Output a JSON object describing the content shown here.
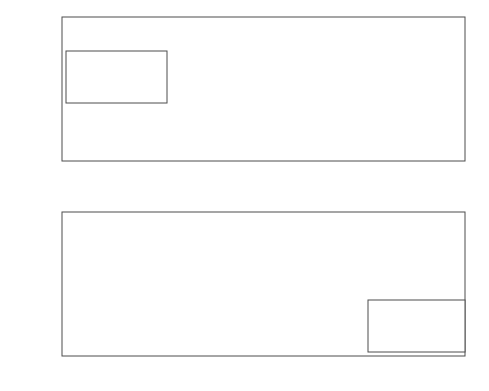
{
  "figure": {
    "title": "",
    "background": "#ffffff",
    "axis_color": "#4d4d4d",
    "grid_color": "#d0d0d0",
    "curve_color": "#3a3a3a",
    "solid_curve_color": "#8a8a8a"
  },
  "chart_data": [
    {
      "type": "line",
      "panel": "top",
      "title": "",
      "xlabel": "R",
      "ylabel": "|G_D|",
      "ylabel_display": "|G",
      "ylabel_sub": "D",
      "ylabel_tail": "|",
      "xlim": [
        0,
        1
      ],
      "ylim": [
        0,
        1.2
      ],
      "xticks": [
        0,
        0.2,
        0.4,
        0.6,
        0.8,
        1
      ],
      "xticklabels": [
        "0",
        "0.2",
        "0.4",
        "0.6",
        "0.8",
        "1"
      ],
      "yticks": [
        0,
        0.2,
        0.4,
        0.6,
        0.8,
        1,
        1.2
      ],
      "yticklabels": [
        "0",
        "0.2",
        "0.4",
        "0.6",
        "0.8",
        "1",
        "1.2"
      ],
      "grid": true,
      "legend_position": "upper-left",
      "series": [
        {
          "name": "eta_m = 0",
          "style": "solid",
          "x": [
            0,
            0.1,
            0.2,
            0.3,
            0.4,
            0.5,
            0.6,
            0.7,
            0.8,
            0.9,
            1.0
          ],
          "values": [
            1.0,
            1.0,
            1.0,
            1.0,
            1.0,
            1.0,
            1.0,
            1.0,
            1.0,
            1.0,
            1.0
          ]
        },
        {
          "name": "eta_m = 5",
          "style": "dashed",
          "x": [
            0,
            0.05,
            0.1,
            0.15,
            0.2,
            0.25,
            0.3,
            0.35,
            0.4,
            0.45,
            0.5,
            0.55,
            0.6,
            0.65,
            0.7,
            0.75,
            0.8,
            0.85,
            0.9,
            0.95,
            1.0
          ],
          "values": [
            0.292,
            0.288,
            0.286,
            0.285,
            0.285,
            0.287,
            0.291,
            0.297,
            0.305,
            0.316,
            0.33,
            0.349,
            0.373,
            0.404,
            0.443,
            0.492,
            0.553,
            0.63,
            0.724,
            0.845,
            1.0
          ]
        },
        {
          "name": "eta_m = 10",
          "style": "dashdot",
          "x": [
            0,
            0.05,
            0.1,
            0.15,
            0.2,
            0.25,
            0.3,
            0.35,
            0.4,
            0.45,
            0.5,
            0.55,
            0.6,
            0.65,
            0.7,
            0.75,
            0.8,
            0.85,
            0.9,
            0.95,
            1.0
          ],
          "values": [
            0.009,
            0.009,
            0.01,
            0.011,
            0.013,
            0.015,
            0.018,
            0.022,
            0.027,
            0.034,
            0.043,
            0.055,
            0.072,
            0.095,
            0.126,
            0.17,
            0.232,
            0.322,
            0.455,
            0.66,
            1.0
          ]
        }
      ]
    },
    {
      "type": "line",
      "panel": "bottom",
      "title": "",
      "xlabel": "R",
      "ylabel": "theta_D/pi",
      "xlim": [
        0,
        1
      ],
      "ylim": [
        -2.5,
        0.5
      ],
      "xticks": [
        0,
        0.2,
        0.4,
        0.6,
        0.8,
        1
      ],
      "xticklabels": [
        "0",
        "0.2",
        "0.4",
        "0.6",
        "0.8",
        "1"
      ],
      "yticks": [
        -2.5,
        -2,
        -1.5,
        -1,
        -0.5,
        0,
        0.5
      ],
      "yticklabels": [
        "-2.5",
        "-2",
        "-1.5",
        "-1",
        "-0.5",
        "0",
        "0.5"
      ],
      "grid": true,
      "legend_position": "lower-right",
      "series": [
        {
          "name": "eta_m = 0",
          "style": "solid",
          "x": [
            0,
            0.2,
            0.4,
            0.6,
            0.8,
            1.0
          ],
          "values": [
            0,
            0,
            0,
            0,
            0,
            0
          ]
        },
        {
          "name": "eta_m = 5",
          "style": "dashed",
          "x": [
            0,
            0.05,
            0.1,
            0.15,
            0.2,
            0.25,
            0.3,
            0.35,
            0.4,
            0.45,
            0.5,
            0.55,
            0.6,
            0.65,
            0.7,
            0.75,
            0.8,
            0.85,
            0.9,
            0.95,
            1.0
          ],
          "values": [
            -0.88,
            -0.878,
            -0.873,
            -0.866,
            -0.856,
            -0.843,
            -0.828,
            -0.81,
            -0.789,
            -0.765,
            -0.738,
            -0.707,
            -0.672,
            -0.632,
            -0.586,
            -0.533,
            -0.47,
            -0.395,
            -0.303,
            -0.185,
            0
          ]
        },
        {
          "name": "eta_m = 10",
          "style": "dashdot",
          "x": [
            0,
            0.05,
            0.1,
            0.15,
            0.2,
            0.25,
            0.3,
            0.35,
            0.4,
            0.45,
            0.5,
            0.55,
            0.6,
            0.65,
            0.7,
            0.75,
            0.8,
            0.85,
            0.9,
            0.95,
            1.0
          ],
          "values": [
            -2.0,
            -2.0,
            -1.985,
            -1.95,
            -1.9,
            -1.835,
            -1.76,
            -1.675,
            -1.585,
            -1.49,
            -1.39,
            -1.287,
            -1.18,
            -1.07,
            -0.955,
            -0.835,
            -0.71,
            -0.575,
            -0.43,
            -0.25,
            0
          ]
        }
      ]
    }
  ],
  "legend_top": {
    "items": [
      {
        "label_base": "η",
        "label_sub": "m",
        "label_val": "= 0",
        "style": "solid"
      },
      {
        "label_base": "η",
        "label_sub": "m",
        "label_val": "= 5",
        "style": "dashed"
      },
      {
        "label_base": "η",
        "label_sub": "m",
        "label_val": "= 10",
        "style": "dashdot"
      }
    ]
  },
  "legend_bottom": {
    "items": [
      {
        "label_base": "η",
        "label_sub": "m",
        "label_val": "= 0",
        "style": "solid"
      },
      {
        "label_base": "η",
        "label_sub": "m",
        "label_val": "= 5",
        "style": "dashed"
      },
      {
        "label_base": "η",
        "label_sub": "m",
        "label_val": "= 10",
        "style": "dashdot"
      }
    ]
  },
  "labels": {
    "x_axis_top": "R",
    "x_axis_bottom": "R",
    "y_axis_top_main": "|G",
    "y_axis_top_sub": "D",
    "y_axis_top_end": "|",
    "y_axis_bottom_main": "θ",
    "y_axis_bottom_sub": "D",
    "y_axis_bottom_end": "/π"
  }
}
